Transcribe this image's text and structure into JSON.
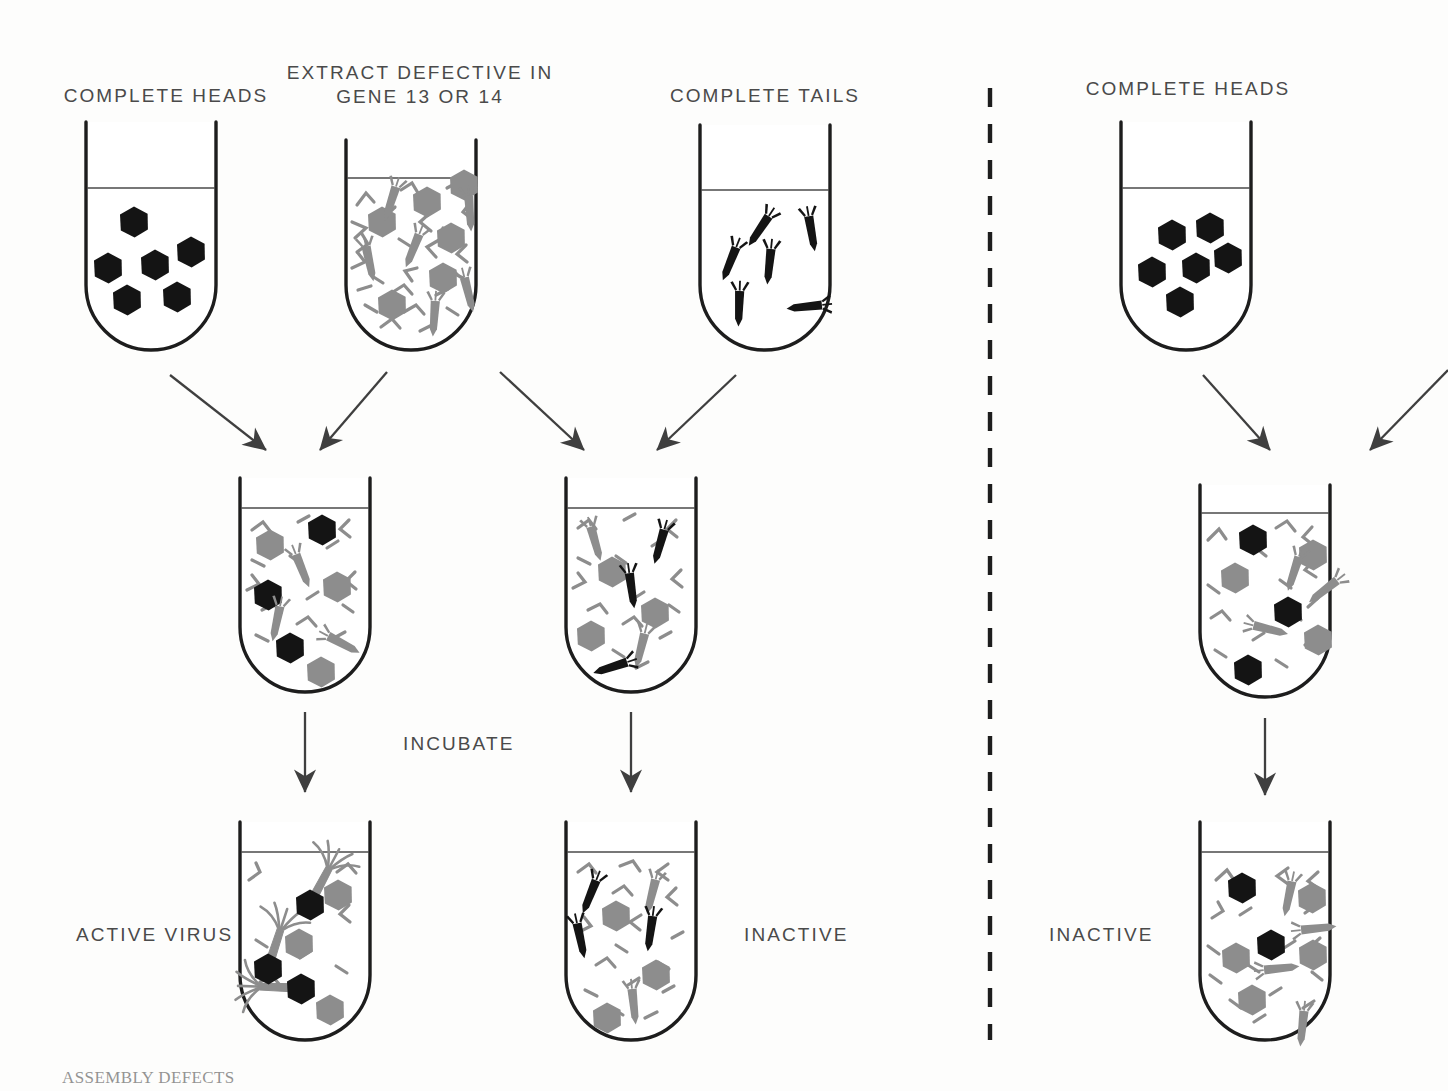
{
  "figure": {
    "domain": "scientific-diagram",
    "title_caption": "ASSEMBLY DEFECTS",
    "background": "#fdfdfc",
    "colors": {
      "outline": "#1d1d1d",
      "gray_part": "#8d8d8d",
      "black_part": "#141414",
      "arrow": "#3f3f3f",
      "label_text": "#4a4a4a",
      "liquid_line": "#4a4a4a",
      "divider": "#1d1d1d"
    }
  },
  "labels": {
    "complete_heads_left": "COMPLETE HEADS",
    "extract_line1": "EXTRACT DEFECTIVE IN",
    "extract_line2": "GENE 13 OR 14",
    "complete_tails": "COMPLETE TAILS",
    "complete_heads_right": "COMPLETE HEADS",
    "incubate": "INCUBATE",
    "active_virus": "ACTIVE VIRUS",
    "inactive_middle": "INACTIVE",
    "inactive_right": "INACTIVE"
  },
  "panels": [
    {
      "name": "left-panel",
      "description": "complementation test: heads plus tails-defective extract yields active virus"
    },
    {
      "name": "right-panel",
      "description": "control: complete heads plus extract defective in both genes stays inactive"
    }
  ],
  "divider": {
    "name": "panel-divider",
    "style": "dashed-vertical",
    "x": 990,
    "y_top": 88,
    "y_bottom": 1040
  },
  "tubes": [
    {
      "id": "tube-complete-heads-left",
      "label": "COMPLETE HEADS",
      "cx": 151,
      "top": 122,
      "width": 130,
      "bottom": 350,
      "liquid_y": 188,
      "contents_summary": "5 black complete heads",
      "black_heads": 5,
      "gray_heads": 0,
      "black_tails": 0,
      "gray_tails": 0,
      "fragments": 0,
      "assembled_virus": 0
    },
    {
      "id": "tube-extract-defective",
      "label": "EXTRACT DEFECTIVE IN GENE 13 OR 14",
      "cx": 411,
      "top": 140,
      "width": 130,
      "bottom": 350,
      "liquid_y": 178,
      "contents_summary": "gray heads, gray tails and many gray protein fragments",
      "black_heads": 0,
      "gray_heads": 6,
      "black_tails": 0,
      "gray_tails": 5,
      "fragments": 26,
      "assembled_virus": 0
    },
    {
      "id": "tube-complete-tails",
      "label": "COMPLETE TAILS",
      "cx": 765,
      "top": 125,
      "width": 130,
      "bottom": 350,
      "liquid_y": 190,
      "contents_summary": "5 black complete tails",
      "black_heads": 0,
      "gray_heads": 0,
      "black_tails": 5,
      "gray_tails": 0,
      "fragments": 0,
      "assembled_virus": 0
    },
    {
      "id": "tube-complete-heads-right",
      "label": "COMPLETE HEADS",
      "cx": 1186,
      "top": 122,
      "width": 130,
      "bottom": 350,
      "liquid_y": 188,
      "contents_summary": "6 black complete heads",
      "black_heads": 6,
      "gray_heads": 0,
      "black_tails": 0,
      "gray_tails": 0,
      "fragments": 0,
      "assembled_virus": 0
    },
    {
      "id": "tube-mix-left",
      "label": "",
      "cx": 305,
      "top": 478,
      "width": 130,
      "bottom": 692,
      "liquid_y": 508,
      "contents_summary": "black heads mixed with gray heads, gray tails and fragments before incubation",
      "black_heads": 3,
      "gray_heads": 3,
      "black_tails": 0,
      "gray_tails": 3,
      "fragments": 16,
      "assembled_virus": 0
    },
    {
      "id": "tube-mix-middle",
      "label": "",
      "cx": 631,
      "top": 478,
      "width": 130,
      "bottom": 692,
      "liquid_y": 508,
      "contents_summary": "black tails mixed with gray heads, gray tails and fragments before incubation",
      "black_heads": 0,
      "gray_heads": 3,
      "black_tails": 3,
      "gray_tails": 2,
      "fragments": 16,
      "assembled_virus": 0
    },
    {
      "id": "tube-mix-right",
      "label": "",
      "cx": 1265,
      "top": 485,
      "width": 130,
      "bottom": 697,
      "liquid_y": 513,
      "contents_summary": "black heads mixed with gray heads, gray tails and fragments",
      "black_heads": 3,
      "gray_heads": 3,
      "black_tails": 0,
      "gray_tails": 3,
      "fragments": 16,
      "assembled_virus": 0
    },
    {
      "id": "tube-result-active",
      "label": "ACTIVE VIRUS",
      "cx": 305,
      "top": 822,
      "width": 130,
      "bottom": 1040,
      "liquid_y": 852,
      "contents_summary": "three assembled active virus particles: black head with gray tail and splayed tail fibers, plus free gray heads and fragments",
      "black_heads": 0,
      "gray_heads": 3,
      "black_tails": 0,
      "gray_tails": 0,
      "fragments": 8,
      "assembled_virus": 3
    },
    {
      "id": "tube-result-inactive-middle",
      "label": "INACTIVE",
      "cx": 631,
      "top": 822,
      "width": 130,
      "bottom": 1040,
      "liquid_y": 852,
      "contents_summary": "no assembly: gray heads with free black and gray tails plus fragments",
      "black_heads": 0,
      "gray_heads": 3,
      "black_tails": 3,
      "gray_tails": 2,
      "fragments": 16,
      "assembled_virus": 0
    },
    {
      "id": "tube-result-inactive-right",
      "label": "INACTIVE",
      "cx": 1265,
      "top": 822,
      "width": 130,
      "bottom": 1040,
      "liquid_y": 852,
      "contents_summary": "no assembly: black and gray heads with free gray tails plus fragments",
      "black_heads": 2,
      "gray_heads": 4,
      "black_tails": 0,
      "gray_tails": 3,
      "fragments": 16,
      "assembled_virus": 0
    }
  ],
  "arrows": [
    {
      "id": "arrow-heads-to-mixleft",
      "from": "tube-complete-heads-left",
      "to": "tube-mix-left",
      "x1": 170,
      "y1": 375,
      "x2": 268,
      "y2": 452
    },
    {
      "id": "arrow-extract-to-mixleft",
      "from": "tube-extract-defective",
      "to": "tube-mix-left",
      "x1": 385,
      "y1": 372,
      "x2": 318,
      "y2": 452
    },
    {
      "id": "arrow-extract-to-mixmid",
      "from": "tube-extract-defective",
      "to": "tube-mix-middle",
      "x1": 500,
      "y1": 372,
      "x2": 586,
      "y2": 452
    },
    {
      "id": "arrow-tails-to-mixmid",
      "from": "tube-complete-tails",
      "to": "tube-mix-middle",
      "x1": 734,
      "y1": 375,
      "x2": 655,
      "y2": 452
    },
    {
      "id": "arrow-mixleft-to-result",
      "from": "tube-mix-left",
      "to": "tube-result-active",
      "x1": 305,
      "y1": 712,
      "x2": 305,
      "y2": 795
    },
    {
      "id": "arrow-mixmid-to-result",
      "from": "tube-mix-middle",
      "to": "tube-result-inactive-middle",
      "x1": 631,
      "y1": 712,
      "x2": 631,
      "y2": 795
    },
    {
      "id": "arrow-heads-to-mixright",
      "from": "tube-complete-heads-right",
      "to": "tube-mix-right",
      "x1": 1203,
      "y1": 375,
      "x2": 1272,
      "y2": 452
    },
    {
      "id": "arrow-offscreen-to-mixright",
      "from": "off-canvas-extract",
      "to": "tube-mix-right",
      "x1": 1448,
      "y1": 372,
      "x2": 1368,
      "y2": 452
    },
    {
      "id": "arrow-mixright-to-result",
      "from": "tube-mix-right",
      "to": "tube-result-inactive-right",
      "x1": 1265,
      "y1": 718,
      "x2": 1265,
      "y2": 798
    }
  ]
}
